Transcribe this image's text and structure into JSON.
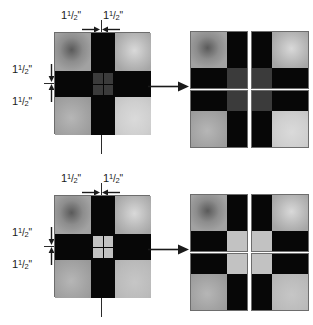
{
  "figure": {
    "caption_present": false,
    "dimension_value": {
      "whole": "1",
      "numerator": "1",
      "slash": "/",
      "denominator": "2",
      "unit": "\""
    },
    "diagrams": [
      {
        "id": "diagram-top",
        "labels": {
          "top_left": "1",
          "top_right": "1",
          "left_upper": "1",
          "left_lower": "1"
        },
        "main_block": {
          "grid": "3x3",
          "corner_patches": [
            "medium-gray",
            "light-gray",
            "medium-gray",
            "lightest-gray"
          ],
          "edge_cells": "black",
          "center_mini_grid": "2x2",
          "center_mini_tone": "dark-gray"
        },
        "quadrants": [
          {
            "name": "quadrant-top-left",
            "large_patch": "top-left",
            "small_patch": "bottom-right",
            "small_tone": "dark-gray"
          },
          {
            "name": "quadrant-top-right",
            "large_patch": "top-right",
            "small_patch": "bottom-left",
            "small_tone": "dark-gray"
          },
          {
            "name": "quadrant-bottom-left",
            "large_patch": "bottom-left",
            "small_patch": "top-right",
            "small_tone": "dark-gray"
          },
          {
            "name": "quadrant-bottom-right",
            "large_patch": "bottom-right",
            "small_patch": "top-left",
            "small_tone": "dark-gray"
          }
        ]
      },
      {
        "id": "diagram-bottom",
        "labels": {
          "top_left": "1",
          "top_right": "1",
          "left_upper": "1",
          "left_lower": "1"
        },
        "main_block": {
          "grid": "3x3",
          "corner_patches": [
            "medium-gray",
            "light-gray",
            "medium-gray",
            "lightest-gray"
          ],
          "edge_cells": "black",
          "center_mini_grid": "2x2",
          "center_mini_tone": "light-gray"
        },
        "quadrants": [
          {
            "name": "quadrant-top-left",
            "large_patch": "top-left",
            "small_patch": "bottom-right",
            "small_tone": "light-gray"
          },
          {
            "name": "quadrant-top-right",
            "large_patch": "top-right",
            "small_patch": "bottom-left",
            "small_tone": "light-gray"
          },
          {
            "name": "quadrant-bottom-left",
            "large_patch": "bottom-left",
            "small_patch": "top-right",
            "small_tone": "light-gray"
          },
          {
            "name": "quadrant-bottom-right",
            "large_patch": "bottom-right",
            "small_patch": "top-left",
            "small_tone": "light-gray"
          }
        ]
      }
    ],
    "colors": {
      "background": "#ffffff",
      "black_cell": "#070707",
      "border": "#6d6d6d",
      "line": "#2b2b2b",
      "mini_dark": "#3b3b3b",
      "mini_light": "#c2c2c2",
      "text": "#1a1a1a"
    }
  }
}
